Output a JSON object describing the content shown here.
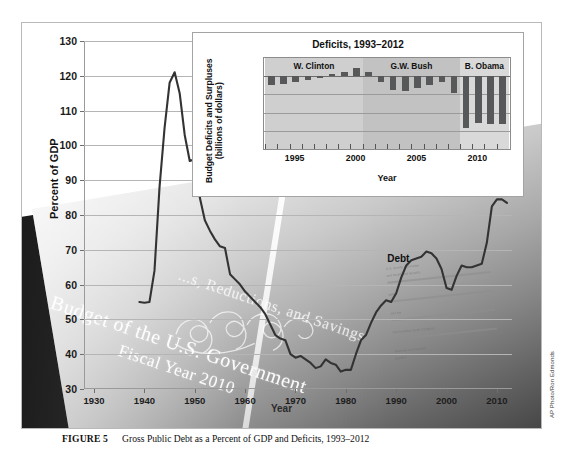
{
  "figure": {
    "caption_label": "FIGURE 5",
    "caption_text": "Gross Public Debt as a Percent of GDP and Deficits, 1993–2012",
    "photo_credit": "AP Photo/Ron Edmonds"
  },
  "background_photo": {
    "cover_line_top": "...s, Reductions, and Savings",
    "cover_line_1": "Budget of the U.S. Government",
    "cover_line_2": "Fiscal Year 2010",
    "page_note_lines": [
      "U.S. Senate Committee",
      "and Health and Benefits",
      "policy",
      "and the",
      "One Hundred Tenth Congress",
      "Revenue and selected",
      "portions"
    ]
  },
  "chart_data": [
    {
      "id": "main",
      "type": "line",
      "title": "",
      "xlabel": "Year",
      "ylabel": "Percent of GDP",
      "xlim": [
        1928,
        2013
      ],
      "ylim": [
        30,
        130
      ],
      "xticks": [
        1930,
        1940,
        1950,
        1960,
        1970,
        1980,
        1990,
        2000,
        2010
      ],
      "yticks": [
        30,
        40,
        50,
        60,
        70,
        80,
        90,
        100,
        110,
        120,
        130
      ],
      "grid": "horizontal",
      "legend": "inline-annotation",
      "annotations": [
        {
          "text": "Debt",
          "x": 1991,
          "y": 67
        }
      ],
      "series": [
        {
          "name": "Debt",
          "color": "#333333",
          "x": [
            1939,
            1940,
            1941,
            1942,
            1943,
            1944,
            1945,
            1946,
            1947,
            1948,
            1949,
            1950,
            1951,
            1952,
            1953,
            1954,
            1955,
            1956,
            1957,
            1958,
            1959,
            1960,
            1961,
            1962,
            1963,
            1964,
            1965,
            1966,
            1967,
            1968,
            1969,
            1970,
            1971,
            1972,
            1973,
            1974,
            1975,
            1976,
            1977,
            1978,
            1979,
            1980,
            1981,
            1982,
            1983,
            1984,
            1985,
            1986,
            1987,
            1988,
            1989,
            1990,
            1991,
            1992,
            1993,
            1994,
            1995,
            1996,
            1997,
            1998,
            1999,
            2000,
            2001,
            2002,
            2003,
            2004,
            2005,
            2006,
            2007,
            2008,
            2009,
            2010,
            2011,
            2012
          ],
          "y": [
            55.0,
            54.8,
            55.0,
            64.0,
            88.0,
            105.0,
            118.0,
            121.0,
            115.0,
            103.0,
            95.5,
            96.0,
            85.0,
            78.5,
            75.5,
            73.0,
            71.0,
            70.5,
            63.0,
            61.5,
            60.0,
            58.0,
            56.5,
            55.0,
            53.5,
            51.5,
            48.5,
            45.5,
            44.5,
            44.0,
            40.0,
            39.0,
            39.5,
            38.5,
            37.5,
            36.0,
            36.5,
            38.5,
            37.5,
            37.0,
            35.0,
            35.5,
            35.5,
            40.0,
            44.0,
            45.5,
            49.0,
            52.0,
            54.0,
            55.5,
            55.0,
            57.5,
            62.0,
            65.5,
            67.0,
            67.5,
            68.0,
            69.5,
            69.0,
            67.5,
            64.5,
            59.0,
            58.5,
            62.5,
            65.5,
            65.0,
            65.0,
            65.5,
            66.0,
            72.0,
            82.5,
            84.5,
            84.5,
            83.5
          ]
        }
      ]
    },
    {
      "id": "inset",
      "type": "bar",
      "title": "Deficits, 1993–2012",
      "xlabel": "Year",
      "ylabel": "Budget Deficits and Surpluses (billions of dollars)",
      "ylabel_line1": "Budget Deficits and Surpluses",
      "ylabel_line2": "(billions of dollars)",
      "ylim": [
        -2000,
        500
      ],
      "yticks": [
        500,
        0,
        -500,
        -1000,
        -1500,
        -2000
      ],
      "xticks": [
        1995,
        2000,
        2005,
        2010
      ],
      "bar_color": "#57585a",
      "grid": "horizontal",
      "categories": [
        1993,
        1994,
        1995,
        1996,
        1997,
        1998,
        1999,
        2000,
        2001,
        2002,
        2003,
        2004,
        2005,
        2006,
        2007,
        2008,
        2009,
        2010,
        2011,
        2012
      ],
      "values": [
        -255,
        -203,
        -164,
        -107,
        -22,
        69,
        126,
        236,
        128,
        -158,
        -378,
        -413,
        -318,
        -248,
        -161,
        -459,
        -1413,
        -1294,
        -1300,
        -1327
      ],
      "bands": [
        {
          "label": "W. Clinton",
          "start": 1993,
          "end": 2000,
          "color": "#cfcfcf"
        },
        {
          "label": "G.W. Bush",
          "start": 2001,
          "end": 2008,
          "color": "#c2c2c2"
        },
        {
          "label": "B. Obama",
          "start": 2009,
          "end": 2012,
          "color": "#d9d9d9"
        }
      ]
    }
  ]
}
